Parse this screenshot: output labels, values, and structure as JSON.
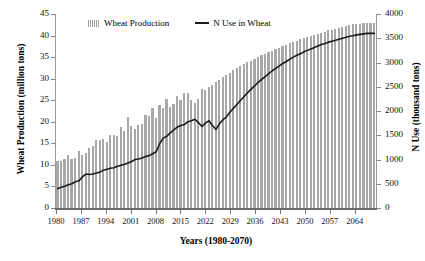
{
  "chart_data": {
    "type": "bar",
    "title": "",
    "xlabel": "Years (1980-2070)",
    "ylabel": "Wheat Production (million tons)",
    "ylabel_secondary": "N Use (thousand tons)",
    "grid": false,
    "legend_position": "top-center",
    "xlim": [
      1980,
      2070
    ],
    "ylim": [
      0,
      45
    ],
    "ylim_secondary": [
      0,
      4000
    ],
    "xticks": [
      1980,
      1987,
      1994,
      2001,
      2008,
      2015,
      2022,
      2029,
      2036,
      2043,
      2050,
      2057,
      2064
    ],
    "yticks": [
      0,
      5,
      10,
      15,
      20,
      25,
      30,
      35,
      40,
      45
    ],
    "yticks_secondary": [
      0,
      500,
      1000,
      1500,
      2000,
      2500,
      3000,
      3500,
      4000
    ],
    "x": [
      1980,
      1981,
      1982,
      1983,
      1984,
      1985,
      1986,
      1987,
      1988,
      1989,
      1990,
      1991,
      1992,
      1993,
      1994,
      1995,
      1996,
      1997,
      1998,
      1999,
      2000,
      2001,
      2002,
      2003,
      2004,
      2005,
      2006,
      2007,
      2008,
      2009,
      2010,
      2011,
      2012,
      2013,
      2014,
      2015,
      2016,
      2017,
      2018,
      2019,
      2020,
      2021,
      2022,
      2023,
      2024,
      2025,
      2026,
      2027,
      2028,
      2029,
      2030,
      2031,
      2032,
      2033,
      2034,
      2035,
      2036,
      2037,
      2038,
      2039,
      2040,
      2041,
      2042,
      2043,
      2044,
      2045,
      2046,
      2047,
      2048,
      2049,
      2050,
      2051,
      2052,
      2053,
      2054,
      2055,
      2056,
      2057,
      2058,
      2059,
      2060,
      2061,
      2062,
      2063,
      2064,
      2065,
      2066,
      2067,
      2068,
      2069,
      2070
    ],
    "series": [
      {
        "name": "Wheat Production",
        "axis": "left",
        "unit": "million tons",
        "color": "#a8a8a8",
        "type": "bar",
        "values": [
          11.0,
          10.8,
          11.3,
          12.2,
          11.4,
          11.7,
          13.3,
          12.2,
          12.7,
          14.0,
          14.4,
          15.7,
          15.7,
          16.1,
          15.2,
          17.0,
          16.9,
          16.7,
          18.7,
          17.9,
          21.1,
          19.0,
          18.4,
          19.2,
          19.5,
          21.6,
          21.3,
          23.3,
          20.9,
          24.0,
          23.3,
          25.2,
          23.5,
          24.2,
          25.9,
          25.1,
          26.6,
          26.7,
          25.1,
          24.3,
          25.2,
          27.5,
          27.4,
          28.0,
          28.6,
          29.2,
          29.8,
          30.4,
          30.9,
          31.4,
          31.9,
          32.4,
          32.9,
          33.4,
          33.8,
          34.2,
          34.6,
          35.0,
          35.4,
          35.8,
          36.2,
          36.5,
          36.9,
          37.2,
          37.5,
          37.9,
          38.2,
          38.5,
          38.8,
          39.1,
          39.4,
          39.6,
          39.9,
          40.2,
          40.4,
          40.7,
          40.9,
          41.2,
          41.4,
          41.6,
          41.8,
          42.0,
          42.2,
          42.4,
          42.6,
          42.7,
          42.8,
          42.9,
          43.0,
          43.0,
          43.0
        ]
      },
      {
        "name": "N Use in Wheat",
        "axis": "right",
        "unit": "thousand tons",
        "color": "#1a1a1a",
        "type": "line",
        "values": [
          400,
          430,
          450,
          480,
          500,
          540,
          560,
          640,
          700,
          690,
          700,
          720,
          740,
          780,
          800,
          820,
          830,
          860,
          880,
          900,
          930,
          960,
          1000,
          1010,
          1030,
          1060,
          1080,
          1120,
          1160,
          1330,
          1440,
          1480,
          1550,
          1610,
          1670,
          1700,
          1720,
          1780,
          1800,
          1830,
          1760,
          1680,
          1750,
          1800,
          1700,
          1620,
          1740,
          1820,
          1880,
          1980,
          2060,
          2140,
          2220,
          2300,
          2380,
          2450,
          2520,
          2590,
          2650,
          2710,
          2770,
          2830,
          2880,
          2930,
          2980,
          3020,
          3070,
          3110,
          3150,
          3180,
          3220,
          3250,
          3280,
          3310,
          3340,
          3370,
          3390,
          3420,
          3440,
          3460,
          3480,
          3500,
          3520,
          3540,
          3550,
          3570,
          3580,
          3590,
          3600,
          3600,
          3600
        ]
      }
    ]
  },
  "legend": {
    "items": [
      {
        "label": "Wheat Production",
        "marker": "bars-swatch"
      },
      {
        "label": "N Use in Wheat",
        "marker": "line-swatch"
      }
    ]
  }
}
